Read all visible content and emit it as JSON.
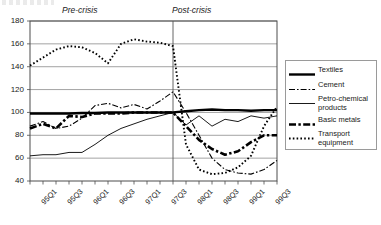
{
  "chart_data": {
    "type": "line",
    "title": "",
    "xlabel": "",
    "ylabel": "",
    "ylim": [
      40,
      180
    ],
    "ytick_values": [
      40,
      60,
      80,
      100,
      120,
      140,
      160,
      180
    ],
    "grid": "horizontal",
    "legend_position": "right-outside",
    "x": [
      "95Q1",
      "95Q2",
      "95Q3",
      "95Q4",
      "96Q1",
      "96Q2",
      "96Q3",
      "96Q4",
      "97Q1",
      "97Q2",
      "97Q3",
      "97Q4",
      "98Q1",
      "98Q2",
      "98Q3",
      "98Q4",
      "99Q1",
      "99Q2",
      "99Q3",
      "99Q4"
    ],
    "xtick_labels": [
      "95Q1",
      "95Q3",
      "96Q1",
      "96Q3",
      "97Q1",
      "97Q3",
      "98Q1",
      "98Q3",
      "99Q1",
      "99Q3"
    ],
    "annotations": [
      {
        "text": "Pre-crisis",
        "position": "above-plot-left",
        "style": "italic"
      },
      {
        "text": "Post-crisis",
        "position": "above-plot-right",
        "style": "italic"
      }
    ],
    "crisis_divider_x": "97Q4",
    "series": [
      {
        "name": "Textiles",
        "style": "thick-solid",
        "values": [
          99,
          99,
          99,
          99,
          99.5,
          99.5,
          100,
          100,
          100,
          100,
          100,
          100,
          101,
          102,
          102.5,
          102,
          102,
          101.5,
          102,
          102
        ]
      },
      {
        "name": "Cement",
        "style": "dash-dot",
        "values": [
          88,
          92,
          86,
          88,
          95,
          106,
          108,
          104,
          107,
          103,
          110,
          118,
          100,
          80,
          60,
          50,
          47,
          46,
          50,
          58
        ]
      },
      {
        "name": "Petro-chemical products",
        "style": "thin-solid",
        "values": [
          62,
          63,
          63,
          65,
          65,
          72,
          80,
          86,
          90,
          94,
          97,
          100,
          89,
          97,
          88,
          94,
          92,
          97,
          95,
          97
        ]
      },
      {
        "name": "Basic metals",
        "style": "heavy-long-dash",
        "values": [
          86,
          90,
          86,
          97,
          96,
          99,
          99,
          99,
          100,
          100,
          100,
          100,
          88,
          76,
          68,
          63,
          66,
          74,
          80,
          80
        ]
      },
      {
        "name": "Transport equipment",
        "style": "dotted",
        "values": [
          141,
          148,
          155,
          158,
          157,
          152,
          143,
          160,
          164,
          162,
          161,
          158,
          72,
          50,
          46,
          47,
          52,
          62,
          88,
          105
        ]
      }
    ]
  },
  "legend": {
    "items": [
      {
        "label": "Textiles",
        "style": "thick-solid"
      },
      {
        "label": "Cement",
        "style": "dash-dot"
      },
      {
        "label": "Petro-chemical products",
        "style": "thin-solid"
      },
      {
        "label": "Basic metals",
        "style": "heavy-long-dash"
      },
      {
        "label": "Transport equipment",
        "style": "dotted"
      }
    ]
  }
}
